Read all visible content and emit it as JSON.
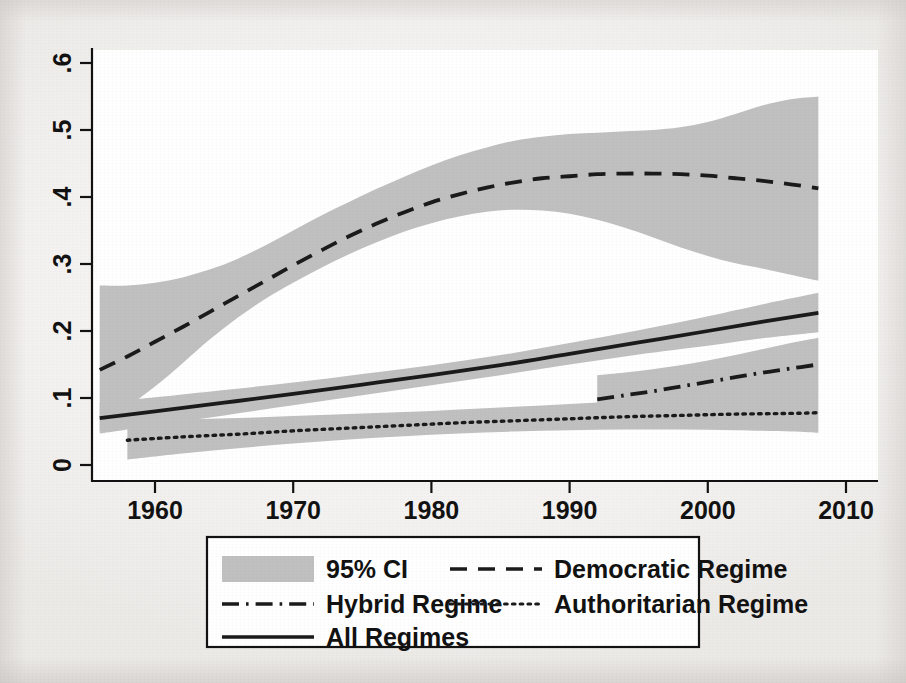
{
  "chart_data": {
    "type": "line",
    "title": "",
    "subtitle": "",
    "xlabel": "",
    "ylabel": "",
    "xlim": [
      1955.5,
      2008.5
    ],
    "ylim": [
      0,
      0.63
    ],
    "xticks": [
      1960,
      1970,
      1980,
      1990,
      2000,
      2010
    ],
    "xtick_labels": [
      "1960",
      "1970",
      "1980",
      "1990",
      "2000",
      "2010"
    ],
    "yticks": [
      0,
      0.1,
      0.2,
      0.3,
      0.4,
      0.5,
      0.6
    ],
    "ytick_labels": [
      "0",
      ".1",
      ".2",
      ".3",
      ".4",
      ".5",
      ".6"
    ],
    "grid": false,
    "legend_position": "below-plot",
    "ci_level": "95%",
    "ci_fill_color": "#c0c0c0",
    "line_color": "#1a1a1a",
    "axis_color": "#000000",
    "background_color": "#f2f0ee",
    "plot_background_color": "#ffffff",
    "series": [
      {
        "name": "Democratic Regime",
        "style": "dashed",
        "x": [
          1956,
          1958,
          1960,
          1962,
          1964,
          1966,
          1968,
          1970,
          1972,
          1974,
          1976,
          1978,
          1980,
          1982,
          1984,
          1986,
          1988,
          1990,
          1992,
          1994,
          1996,
          1998,
          2000,
          2002,
          2004,
          2006,
          2008
        ],
        "values": [
          0.142,
          0.162,
          0.184,
          0.206,
          0.229,
          0.252,
          0.275,
          0.298,
          0.32,
          0.341,
          0.36,
          0.377,
          0.392,
          0.404,
          0.414,
          0.422,
          0.428,
          0.431,
          0.434,
          0.435,
          0.435,
          0.434,
          0.432,
          0.428,
          0.424,
          0.419,
          0.413
        ],
        "ci_lower": [
          0.052,
          0.086,
          0.117,
          0.152,
          0.188,
          0.22,
          0.248,
          0.272,
          0.294,
          0.314,
          0.332,
          0.348,
          0.361,
          0.371,
          0.378,
          0.381,
          0.38,
          0.375,
          0.366,
          0.354,
          0.34,
          0.325,
          0.312,
          0.301,
          0.293,
          0.284,
          0.275
        ],
        "ci_upper": [
          0.268,
          0.268,
          0.272,
          0.28,
          0.292,
          0.308,
          0.328,
          0.35,
          0.372,
          0.392,
          0.412,
          0.43,
          0.447,
          0.462,
          0.474,
          0.484,
          0.49,
          0.494,
          0.496,
          0.498,
          0.5,
          0.504,
          0.512,
          0.524,
          0.537,
          0.546,
          0.55
        ]
      },
      {
        "name": "All Regimes",
        "style": "solid",
        "x": [
          1956,
          1960,
          1965,
          1970,
          1975,
          1980,
          1985,
          1990,
          1995,
          2000,
          2004,
          2008
        ],
        "values": [
          0.07,
          0.08,
          0.093,
          0.106,
          0.12,
          0.134,
          0.149,
          0.166,
          0.183,
          0.2,
          0.214,
          0.227
        ],
        "ci_lower": [
          0.047,
          0.059,
          0.074,
          0.089,
          0.104,
          0.119,
          0.134,
          0.15,
          0.165,
          0.178,
          0.189,
          0.198
        ],
        "ci_upper": [
          0.093,
          0.101,
          0.112,
          0.123,
          0.136,
          0.149,
          0.164,
          0.182,
          0.201,
          0.222,
          0.24,
          0.257
        ]
      },
      {
        "name": "Authoritarian Regime",
        "style": "dotted",
        "x": [
          1958,
          1962,
          1966,
          1970,
          1974,
          1978,
          1982,
          1986,
          1990,
          1994,
          1998,
          2002,
          2006,
          2008
        ],
        "values": [
          0.037,
          0.042,
          0.046,
          0.051,
          0.055,
          0.059,
          0.063,
          0.066,
          0.069,
          0.072,
          0.074,
          0.076,
          0.077,
          0.078
        ],
        "ci_lower": [
          0.008,
          0.017,
          0.025,
          0.032,
          0.038,
          0.043,
          0.047,
          0.05,
          0.052,
          0.053,
          0.053,
          0.052,
          0.05,
          0.048
        ],
        "ci_upper": [
          0.066,
          0.068,
          0.07,
          0.073,
          0.076,
          0.079,
          0.083,
          0.087,
          0.091,
          0.096,
          0.101,
          0.106,
          0.111,
          0.114
        ]
      },
      {
        "name": "Hybrid Regime",
        "style": "dash-dot",
        "x": [
          1992,
          1994,
          1996,
          1998,
          2000,
          2002,
          2004,
          2006,
          2008
        ],
        "values": [
          0.098,
          0.104,
          0.11,
          0.117,
          0.124,
          0.131,
          0.138,
          0.144,
          0.15
        ],
        "ci_lower": [
          0.062,
          0.071,
          0.079,
          0.086,
          0.093,
          0.099,
          0.104,
          0.109,
          0.113
        ],
        "ci_upper": [
          0.134,
          0.138,
          0.143,
          0.149,
          0.156,
          0.164,
          0.173,
          0.182,
          0.19
        ]
      }
    ]
  },
  "axes": {
    "y_tick_labels": [
      "0",
      ".1",
      ".2",
      ".3",
      ".4",
      ".5",
      ".6"
    ],
    "x_tick_labels": [
      "1960",
      "1970",
      "1980",
      "1990",
      "2000",
      "2010"
    ]
  },
  "legend": {
    "entries": [
      {
        "label": "95% CI",
        "style": "band"
      },
      {
        "label": "Democratic Regime",
        "style": "dashed"
      },
      {
        "label": "Hybrid Regime",
        "style": "dash-dot"
      },
      {
        "label": "Authoritarian Regime",
        "style": "dotted"
      },
      {
        "label": "All Regimes",
        "style": "solid"
      }
    ]
  }
}
